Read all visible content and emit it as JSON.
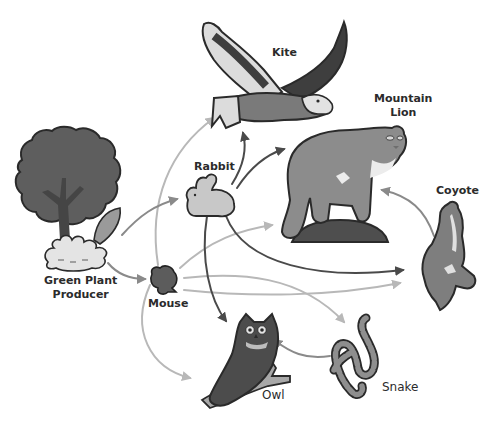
{
  "organisms": {
    "plant": {
      "label_line1": "Green Plant",
      "label_line2": "Producer",
      "role": "producer"
    },
    "rabbit": {
      "label": "Rabbit"
    },
    "mouse": {
      "label": "Mouse"
    },
    "kite": {
      "label": "Kite"
    },
    "lion": {
      "label_line1": "Mountain",
      "label_line2": "Lion"
    },
    "coyote": {
      "label": "Coyote"
    },
    "owl": {
      "label": "Owl"
    },
    "snake": {
      "label": "Snake"
    }
  },
  "edges": [
    {
      "from": "Green Plant",
      "to": "Rabbit",
      "shade": "medium"
    },
    {
      "from": "Green Plant",
      "to": "Mouse",
      "shade": "medium"
    },
    {
      "from": "Rabbit",
      "to": "Kite",
      "shade": "dark"
    },
    {
      "from": "Rabbit",
      "to": "Mountain Lion",
      "shade": "dark"
    },
    {
      "from": "Rabbit",
      "to": "Coyote",
      "shade": "dark"
    },
    {
      "from": "Rabbit",
      "to": "Owl",
      "shade": "dark"
    },
    {
      "from": "Mouse",
      "to": "Kite",
      "shade": "light"
    },
    {
      "from": "Mouse",
      "to": "Mountain Lion",
      "shade": "light"
    },
    {
      "from": "Mouse",
      "to": "Coyote",
      "shade": "light"
    },
    {
      "from": "Mouse",
      "to": "Snake",
      "shade": "light"
    },
    {
      "from": "Mouse",
      "to": "Owl",
      "shade": "light"
    },
    {
      "from": "Snake",
      "to": "Owl",
      "shade": "medium"
    },
    {
      "from": "Coyote",
      "to": "Mountain Lion",
      "shade": "medium"
    }
  ],
  "colors": {
    "background": "#ffffff",
    "arrow_dark": "#4a4a4a",
    "arrow_medium": "#8a8a8a",
    "arrow_light": "#b8b8b8",
    "outline": "#2a2a2a",
    "tree": "#5e5e5e",
    "tree_dark": "#4a4a4a",
    "grass": "#e6e6e6",
    "rabbit": "#c8c8c8",
    "mouse": "#5c5c5c",
    "kite_dark": "#3e3e3e",
    "kite_mid": "#7a7a7a",
    "kite_light": "#dcdcdc",
    "lion": "#8c8c8c",
    "lion_base": "#4e4e4e",
    "coyote": "#7e7e7e",
    "owl": "#4c4c4c",
    "branch": "#a8a8a8",
    "snake": "#8e8e8e"
  }
}
